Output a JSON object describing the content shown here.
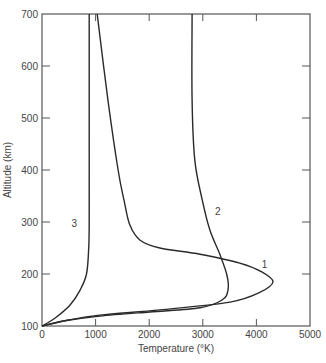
{
  "chart_data": {
    "type": "line",
    "title": "",
    "xlabel": "Temperature (°K)",
    "ylabel": "Altitude (km)",
    "xlim": [
      0,
      5000
    ],
    "ylim": [
      100,
      700
    ],
    "xticks": [
      0,
      1000,
      2000,
      3000,
      4000,
      5000
    ],
    "yticks": [
      100,
      200,
      300,
      400,
      500,
      600,
      700
    ],
    "grid": false,
    "legend": "none (curves labeled inline 1, 2, 3)",
    "series": [
      {
        "name": "1",
        "points": [
          [
            1030,
            700
          ],
          [
            1230,
            535
          ],
          [
            1420,
            400
          ],
          [
            1530,
            342
          ],
          [
            1640,
            294
          ],
          [
            1830,
            265
          ],
          [
            2200,
            250
          ],
          [
            2950,
            238
          ],
          [
            3690,
            221
          ],
          [
            4100,
            204
          ],
          [
            4310,
            185
          ],
          [
            4070,
            165
          ],
          [
            3510,
            146
          ],
          [
            2200,
            131
          ],
          [
            1080,
            121
          ],
          [
            520,
            112
          ],
          [
            0,
            100
          ]
        ]
      },
      {
        "name": "2",
        "points": [
          [
            2800,
            700
          ],
          [
            2800,
            535
          ],
          [
            2850,
            419
          ],
          [
            2990,
            342
          ],
          [
            3130,
            285
          ],
          [
            3320,
            237
          ],
          [
            3450,
            198
          ],
          [
            3470,
            169
          ],
          [
            3360,
            150
          ],
          [
            2950,
            135
          ],
          [
            2010,
            127
          ],
          [
            1080,
            119
          ],
          [
            430,
            110
          ],
          [
            0,
            100
          ]
        ]
      },
      {
        "name": "3",
        "points": [
          [
            880,
            700
          ],
          [
            880,
            500
          ],
          [
            880,
            300
          ],
          [
            870,
            246
          ],
          [
            830,
            200
          ],
          [
            710,
            169
          ],
          [
            520,
            140
          ],
          [
            240,
            115
          ],
          [
            0,
            100
          ]
        ]
      }
    ],
    "annotations": [
      {
        "text": "1",
        "T": 4150,
        "alt": 212
      },
      {
        "text": "2",
        "T": 3280,
        "alt": 313
      },
      {
        "text": "3",
        "T": 600,
        "alt": 290
      }
    ]
  },
  "axes": {
    "x_label": "Temperature (°K)",
    "y_label": "Altitude (km)",
    "x_tick_labels": [
      "0",
      "1000",
      "2000",
      "3000",
      "4000",
      "5000"
    ],
    "y_tick_labels": [
      "100",
      "200",
      "300",
      "400",
      "500",
      "600",
      "700"
    ]
  },
  "colors": {
    "line": "#2a2a2a",
    "axis": "#555555",
    "text": "#444444"
  }
}
